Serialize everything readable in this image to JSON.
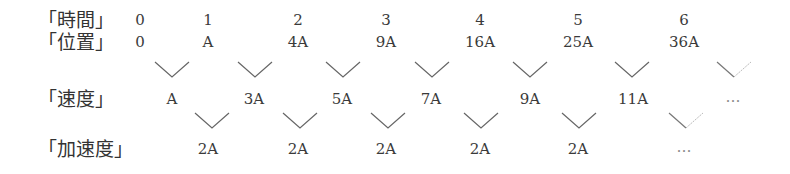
{
  "rows": {
    "time": {
      "label": "「時間」",
      "values": [
        "0",
        "1",
        "2",
        "3",
        "4",
        "5",
        "6"
      ]
    },
    "position": {
      "label": "「位置」",
      "values": [
        "0",
        "A",
        "4A",
        "9A",
        "16A",
        "25A",
        "36A"
      ]
    },
    "velocity": {
      "label": "「速度」",
      "values": [
        "A",
        "3A",
        "5A",
        "7A",
        "9A",
        "11A",
        "…"
      ]
    },
    "acceleration": {
      "label": "「加速度」",
      "values": [
        "2A",
        "2A",
        "2A",
        "2A",
        "2A",
        "…"
      ]
    }
  },
  "colors": {
    "text": "#3a3a3a",
    "line": "#666666",
    "faded_line": "#bbbbbb"
  }
}
